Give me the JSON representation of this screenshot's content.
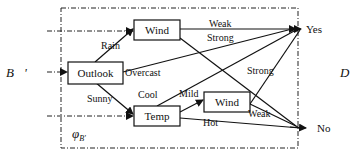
{
  "diagram": {
    "input_symbol": "B⃗'",
    "output_symbol": "D⃗",
    "mapping_symbol": "φ",
    "mapping_subscript": "B'",
    "nodes": {
      "outlook": "Outlook",
      "wind_top": "Wind",
      "temp": "Temp",
      "wind_bottom": "Wind"
    },
    "outcomes": {
      "yes": "Yes",
      "no": "No"
    },
    "edge_labels": {
      "rain": "Rain",
      "overcast": "Overcast",
      "sunny": "Sunny",
      "weak_top": "Weak",
      "strong_top": "Strong",
      "cool": "Cool",
      "mild": "Mild",
      "hot": "Hot",
      "strong_bottom": "Strong",
      "weak_bottom": "Weak"
    }
  }
}
